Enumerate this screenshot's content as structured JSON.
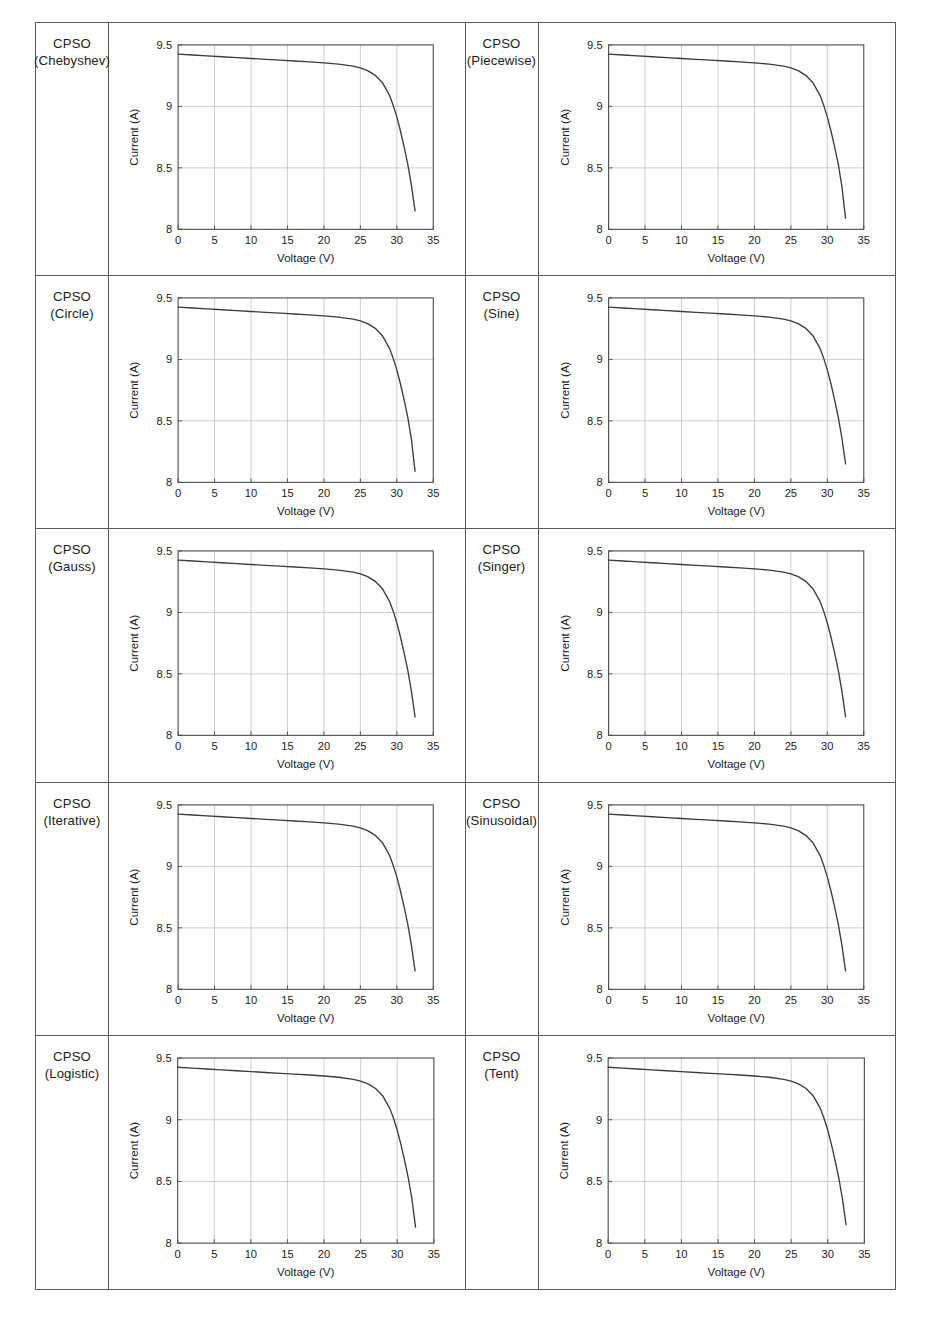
{
  "figure": {
    "kind": "table-of-charts",
    "rows": 5,
    "columns": 2,
    "panel_count": 10
  },
  "panels": [
    {
      "label_line1": "CPSO",
      "label_line2": "(Chebyshev)"
    },
    {
      "label_line1": "CPSO",
      "label_line2": "(Piecewise)"
    },
    {
      "label_line1": "CPSO",
      "label_line2": "(Circle)"
    },
    {
      "label_line1": "CPSO",
      "label_line2": "(Sine)"
    },
    {
      "label_line1": "CPSO",
      "label_line2": "(Gauss)"
    },
    {
      "label_line1": "CPSO",
      "label_line2": "(Singer)"
    },
    {
      "label_line1": "CPSO",
      "label_line2": "(Iterative)"
    },
    {
      "label_line1": "CPSO",
      "label_line2": "(Sinusoidal)"
    },
    {
      "label_line1": "CPSO",
      "label_line2": "(Logistic)"
    },
    {
      "label_line1": "CPSO",
      "label_line2": "(Tent)"
    }
  ],
  "chart_data": [
    {
      "type": "line",
      "title": "",
      "xlabel": "Voltage (V)",
      "ylabel": "Current (A)",
      "xlim": [
        0,
        35
      ],
      "ylim": [
        8,
        9.5
      ],
      "xticks": [
        0,
        5,
        10,
        15,
        20,
        25,
        30,
        35
      ],
      "xticklabels": [
        "0",
        "5",
        "10",
        "15",
        "20",
        "25",
        "30",
        "35"
      ],
      "yticks": [
        8,
        8.5,
        9,
        9.5
      ],
      "yticklabels": [
        "8",
        "8.5",
        "9",
        "9.5"
      ],
      "grid": true,
      "legend": "none",
      "line_color": "#3c3c3c",
      "series": [
        {
          "name": "I-V curve",
          "x": [
            0,
            2,
            4,
            6,
            8,
            10,
            12,
            14,
            16,
            18,
            20,
            22,
            24,
            25,
            26,
            27,
            28,
            29,
            29.5,
            30,
            30.5,
            31,
            31.5,
            32,
            32.5
          ],
          "y": [
            9.425,
            9.418,
            9.411,
            9.404,
            9.397,
            9.39,
            9.383,
            9.376,
            9.369,
            9.362,
            9.354,
            9.344,
            9.327,
            9.313,
            9.291,
            9.255,
            9.195,
            9.09,
            9.01,
            8.915,
            8.8,
            8.67,
            8.53,
            8.36,
            8.15
          ]
        }
      ]
    },
    {
      "type": "line",
      "title": "",
      "xlabel": "Voltage (V)",
      "ylabel": "Current (A)",
      "xlim": [
        0,
        35
      ],
      "ylim": [
        8,
        9.5
      ],
      "xticks": [
        0,
        5,
        10,
        15,
        20,
        25,
        30,
        35
      ],
      "xticklabels": [
        "0",
        "5",
        "10",
        "15",
        "20",
        "25",
        "30",
        "35"
      ],
      "yticks": [
        8,
        8.5,
        9,
        9.5
      ],
      "yticklabels": [
        "8",
        "8.5",
        "9",
        "9.5"
      ],
      "grid": true,
      "legend": "none",
      "line_color": "#3c3c3c",
      "series": [
        {
          "name": "I-V curve",
          "x": [
            0,
            2,
            4,
            6,
            8,
            10,
            12,
            14,
            16,
            18,
            20,
            22,
            24,
            25,
            26,
            27,
            28,
            29,
            29.5,
            30,
            30.5,
            31,
            31.5,
            32,
            32.5
          ],
          "y": [
            9.425,
            9.418,
            9.411,
            9.404,
            9.397,
            9.39,
            9.383,
            9.376,
            9.369,
            9.362,
            9.354,
            9.344,
            9.327,
            9.313,
            9.291,
            9.255,
            9.195,
            9.09,
            9.01,
            8.915,
            8.8,
            8.67,
            8.53,
            8.35,
            8.09
          ]
        }
      ]
    },
    {
      "type": "line",
      "title": "",
      "xlabel": "Voltage (V)",
      "ylabel": "Current (A)",
      "xlim": [
        0,
        35
      ],
      "ylim": [
        8,
        9.5
      ],
      "xticks": [
        0,
        5,
        10,
        15,
        20,
        25,
        30,
        35
      ],
      "xticklabels": [
        "0",
        "5",
        "10",
        "15",
        "20",
        "25",
        "30",
        "35"
      ],
      "yticks": [
        8,
        8.5,
        9,
        9.5
      ],
      "yticklabels": [
        "8",
        "8.5",
        "9",
        "9.5"
      ],
      "grid": true,
      "legend": "none",
      "line_color": "#3c3c3c",
      "series": [
        {
          "name": "I-V curve",
          "x": [
            0,
            2,
            4,
            6,
            8,
            10,
            12,
            14,
            16,
            18,
            20,
            22,
            24,
            25,
            26,
            27,
            28,
            29,
            29.5,
            30,
            30.5,
            31,
            31.5,
            32,
            32.5
          ],
          "y": [
            9.425,
            9.418,
            9.411,
            9.404,
            9.397,
            9.39,
            9.383,
            9.376,
            9.369,
            9.362,
            9.354,
            9.344,
            9.327,
            9.313,
            9.291,
            9.255,
            9.195,
            9.09,
            9.01,
            8.915,
            8.8,
            8.67,
            8.53,
            8.35,
            8.09
          ]
        }
      ]
    },
    {
      "type": "line",
      "title": "",
      "xlabel": "Voltage (V)",
      "ylabel": "Current (A)",
      "xlim": [
        0,
        35
      ],
      "ylim": [
        8,
        9.5
      ],
      "xticks": [
        0,
        5,
        10,
        15,
        20,
        25,
        30,
        35
      ],
      "xticklabels": [
        "0",
        "5",
        "10",
        "15",
        "20",
        "25",
        "30",
        "35"
      ],
      "yticks": [
        8,
        8.5,
        9,
        9.5
      ],
      "yticklabels": [
        "8",
        "8.5",
        "9",
        "9.5"
      ],
      "grid": true,
      "legend": "none",
      "line_color": "#3c3c3c",
      "series": [
        {
          "name": "I-V curve",
          "x": [
            0,
            2,
            4,
            6,
            8,
            10,
            12,
            14,
            16,
            18,
            20,
            22,
            24,
            25,
            26,
            27,
            28,
            29,
            29.5,
            30,
            30.5,
            31,
            31.5,
            32,
            32.5
          ],
          "y": [
            9.425,
            9.418,
            9.411,
            9.404,
            9.397,
            9.39,
            9.383,
            9.376,
            9.369,
            9.362,
            9.354,
            9.344,
            9.327,
            9.313,
            9.291,
            9.255,
            9.195,
            9.09,
            9.01,
            8.915,
            8.8,
            8.67,
            8.53,
            8.36,
            8.15
          ]
        }
      ]
    },
    {
      "type": "line",
      "title": "",
      "xlabel": "Voltage (V)",
      "ylabel": "Current (A)",
      "xlim": [
        0,
        35
      ],
      "ylim": [
        8,
        9.5
      ],
      "xticks": [
        0,
        5,
        10,
        15,
        20,
        25,
        30,
        35
      ],
      "xticklabels": [
        "0",
        "5",
        "10",
        "15",
        "20",
        "25",
        "30",
        "35"
      ],
      "yticks": [
        8,
        8.5,
        9,
        9.5
      ],
      "yticklabels": [
        "8",
        "8.5",
        "9",
        "9.5"
      ],
      "grid": true,
      "legend": "none",
      "line_color": "#3c3c3c",
      "series": [
        {
          "name": "I-V curve",
          "x": [
            0,
            2,
            4,
            6,
            8,
            10,
            12,
            14,
            16,
            18,
            20,
            22,
            24,
            25,
            26,
            27,
            28,
            29,
            29.5,
            30,
            30.5,
            31,
            31.5,
            32,
            32.5
          ],
          "y": [
            9.425,
            9.418,
            9.411,
            9.404,
            9.397,
            9.39,
            9.383,
            9.376,
            9.369,
            9.362,
            9.354,
            9.344,
            9.327,
            9.313,
            9.291,
            9.255,
            9.195,
            9.09,
            9.01,
            8.915,
            8.8,
            8.67,
            8.53,
            8.36,
            8.15
          ]
        }
      ]
    },
    {
      "type": "line",
      "title": "",
      "xlabel": "Voltage (V)",
      "ylabel": "Current (A)",
      "xlim": [
        0,
        35
      ],
      "ylim": [
        8,
        9.5
      ],
      "xticks": [
        0,
        5,
        10,
        15,
        20,
        25,
        30,
        35
      ],
      "xticklabels": [
        "0",
        "5",
        "10",
        "15",
        "20",
        "25",
        "30",
        "35"
      ],
      "yticks": [
        8,
        8.5,
        9,
        9.5
      ],
      "yticklabels": [
        "8",
        "8.5",
        "9",
        "9.5"
      ],
      "grid": true,
      "legend": "none",
      "line_color": "#3c3c3c",
      "series": [
        {
          "name": "I-V curve",
          "x": [
            0,
            2,
            4,
            6,
            8,
            10,
            12,
            14,
            16,
            18,
            20,
            22,
            24,
            25,
            26,
            27,
            28,
            29,
            29.5,
            30,
            30.5,
            31,
            31.5,
            32,
            32.5
          ],
          "y": [
            9.425,
            9.418,
            9.411,
            9.404,
            9.397,
            9.39,
            9.383,
            9.376,
            9.369,
            9.362,
            9.354,
            9.344,
            9.327,
            9.313,
            9.291,
            9.255,
            9.195,
            9.09,
            9.01,
            8.915,
            8.8,
            8.67,
            8.53,
            8.36,
            8.15
          ]
        }
      ]
    },
    {
      "type": "line",
      "title": "",
      "xlabel": "Voltage (V)",
      "ylabel": "Current (A)",
      "xlim": [
        0,
        35
      ],
      "ylim": [
        8,
        9.5
      ],
      "xticks": [
        0,
        5,
        10,
        15,
        20,
        25,
        30,
        35
      ],
      "xticklabels": [
        "0",
        "5",
        "10",
        "15",
        "20",
        "25",
        "30",
        "35"
      ],
      "yticks": [
        8,
        8.5,
        9,
        9.5
      ],
      "yticklabels": [
        "8",
        "8.5",
        "9",
        "9.5"
      ],
      "grid": true,
      "legend": "none",
      "line_color": "#3c3c3c",
      "series": [
        {
          "name": "I-V curve",
          "x": [
            0,
            2,
            4,
            6,
            8,
            10,
            12,
            14,
            16,
            18,
            20,
            22,
            24,
            25,
            26,
            27,
            28,
            29,
            29.5,
            30,
            30.5,
            31,
            31.5,
            32,
            32.5
          ],
          "y": [
            9.425,
            9.418,
            9.411,
            9.404,
            9.397,
            9.39,
            9.383,
            9.376,
            9.369,
            9.362,
            9.354,
            9.344,
            9.327,
            9.313,
            9.291,
            9.255,
            9.195,
            9.09,
            9.01,
            8.915,
            8.8,
            8.67,
            8.53,
            8.36,
            8.15
          ]
        }
      ]
    },
    {
      "type": "line",
      "title": "",
      "xlabel": "Voltage (V)",
      "ylabel": "Current (A)",
      "xlim": [
        0,
        35
      ],
      "ylim": [
        8,
        9.5
      ],
      "xticks": [
        0,
        5,
        10,
        15,
        20,
        25,
        30,
        35
      ],
      "xticklabels": [
        "0",
        "5",
        "10",
        "15",
        "20",
        "25",
        "30",
        "35"
      ],
      "yticks": [
        8,
        8.5,
        9,
        9.5
      ],
      "yticklabels": [
        "8",
        "8.5",
        "9",
        "9.5"
      ],
      "grid": true,
      "legend": "none",
      "line_color": "#3c3c3c",
      "series": [
        {
          "name": "I-V curve",
          "x": [
            0,
            2,
            4,
            6,
            8,
            10,
            12,
            14,
            16,
            18,
            20,
            22,
            24,
            25,
            26,
            27,
            28,
            29,
            29.5,
            30,
            30.5,
            31,
            31.5,
            32,
            32.5
          ],
          "y": [
            9.425,
            9.418,
            9.411,
            9.404,
            9.397,
            9.39,
            9.383,
            9.376,
            9.369,
            9.362,
            9.354,
            9.344,
            9.327,
            9.313,
            9.291,
            9.255,
            9.195,
            9.09,
            9.01,
            8.915,
            8.8,
            8.67,
            8.53,
            8.36,
            8.15
          ]
        }
      ]
    },
    {
      "type": "line",
      "title": "",
      "xlabel": "Voltage (V)",
      "ylabel": "Current (A)",
      "xlim": [
        0,
        35
      ],
      "ylim": [
        8,
        9.5
      ],
      "xticks": [
        0,
        5,
        10,
        15,
        20,
        25,
        30,
        35
      ],
      "xticklabels": [
        "0",
        "5",
        "10",
        "15",
        "20",
        "25",
        "30",
        "35"
      ],
      "yticks": [
        8,
        8.5,
        9,
        9.5
      ],
      "yticklabels": [
        "8",
        "8.5",
        "9",
        "9.5"
      ],
      "grid": true,
      "legend": "none",
      "line_color": "#3c3c3c",
      "series": [
        {
          "name": "I-V curve",
          "x": [
            0,
            2,
            4,
            6,
            8,
            10,
            12,
            14,
            16,
            18,
            20,
            22,
            24,
            25,
            26,
            27,
            28,
            29,
            29.5,
            30,
            30.5,
            31,
            31.5,
            32,
            32.5
          ],
          "y": [
            9.425,
            9.418,
            9.411,
            9.404,
            9.397,
            9.39,
            9.383,
            9.376,
            9.369,
            9.362,
            9.354,
            9.344,
            9.327,
            9.313,
            9.291,
            9.255,
            9.195,
            9.09,
            9.01,
            8.915,
            8.8,
            8.67,
            8.53,
            8.36,
            8.13
          ]
        }
      ]
    },
    {
      "type": "line",
      "title": "",
      "xlabel": "Voltage (V)",
      "ylabel": "Current (A)",
      "xlim": [
        0,
        35
      ],
      "ylim": [
        8,
        9.5
      ],
      "xticks": [
        0,
        5,
        10,
        15,
        20,
        25,
        30,
        35
      ],
      "xticklabels": [
        "0",
        "5",
        "10",
        "15",
        "20",
        "25",
        "30",
        "35"
      ],
      "yticks": [
        8,
        8.5,
        9,
        9.5
      ],
      "yticklabels": [
        "8",
        "8.5",
        "9",
        "9.5"
      ],
      "grid": true,
      "legend": "none",
      "line_color": "#3c3c3c",
      "series": [
        {
          "name": "I-V curve",
          "x": [
            0,
            2,
            4,
            6,
            8,
            10,
            12,
            14,
            16,
            18,
            20,
            22,
            24,
            25,
            26,
            27,
            28,
            29,
            29.5,
            30,
            30.5,
            31,
            31.5,
            32,
            32.5
          ],
          "y": [
            9.425,
            9.418,
            9.411,
            9.404,
            9.397,
            9.39,
            9.383,
            9.376,
            9.369,
            9.362,
            9.354,
            9.344,
            9.327,
            9.313,
            9.291,
            9.255,
            9.195,
            9.09,
            9.01,
            8.915,
            8.8,
            8.67,
            8.53,
            8.36,
            8.15
          ]
        }
      ]
    }
  ],
  "colors": {
    "border": "#5b5b5b",
    "grid": "#b9b9b9",
    "axis": "#4a4a4a",
    "curve": "#3c3c3c",
    "text": "#1c1c1c"
  }
}
